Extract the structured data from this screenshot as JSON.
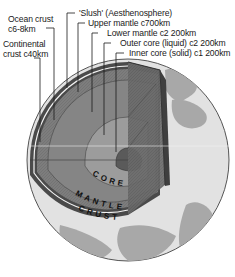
{
  "diagram": {
    "labels": {
      "ocean_crust_line1": "Ocean crust",
      "ocean_crust_line2": "c6-8km",
      "continental_crust_line1": "Continental",
      "continental_crust_line2": "crust c40km",
      "slush": "'Slush' (Aesthenosphere)",
      "upper_mantle": "Upper mantle c700km",
      "lower_mantle": "Lower mantle c2 200km",
      "outer_core": "Outer core (liquid) c2 200km",
      "inner_core": "Inner core (solid) c1 200km"
    },
    "section_labels": {
      "core": "CORE",
      "mantle": "MANTLE",
      "crust": "CRUST"
    },
    "colors": {
      "land": "#a9a9a9",
      "ocean": "#dcdcdc",
      "crust": "#4d4d4d",
      "upper_mantle": "#7a7a7a",
      "lower_mantle": "#8c8c8c",
      "outer_core": "#9e9e9e",
      "inner_core": "#5a5a5a",
      "cut_face": "#6e6e6e"
    }
  }
}
